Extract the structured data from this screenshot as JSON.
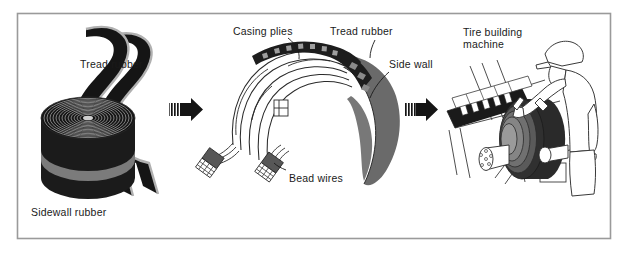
{
  "figure": {
    "border_color": "#9a9a9a",
    "background_color": "#ffffff",
    "ink_color": "#1a1a1a",
    "rubber_dark": "#151515",
    "rubber_mid": "#4f4f4f",
    "rubber_light": "#8f8f8f",
    "highlight_gray": "#b8b8b8"
  },
  "panels": [
    {
      "id": "raw-materials",
      "labels": {
        "tread_rubber": "Tread rubber",
        "sidewall_rubber": "Sidewall rubber"
      }
    },
    {
      "id": "tire-cross-section",
      "labels": {
        "casing_plies": "Casing plies",
        "tread_rubber": "Tread rubber",
        "side_wall": "Side wall",
        "bead_wires": "Bead wires"
      }
    },
    {
      "id": "assembly",
      "labels": {
        "machine_line1": "Tire building",
        "machine_line2": "machine"
      }
    }
  ],
  "arrows": [
    {
      "id": "arrow-1",
      "direction": "right"
    },
    {
      "id": "arrow-2",
      "direction": "right"
    }
  ]
}
